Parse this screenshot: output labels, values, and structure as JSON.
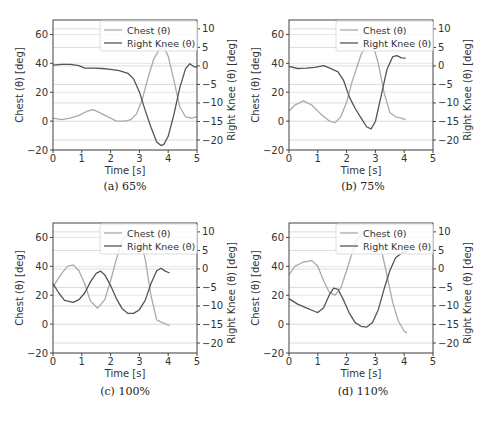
{
  "chart_data": [
    {
      "type": "line",
      "caption": "(a) 65%",
      "xlabel": "Time [s]",
      "ylabel": "Chest (θ) [deg]",
      "ylabel_right": "Right Knee (θ) [deg]",
      "xlim": [
        0,
        5
      ],
      "ylim": [
        -20,
        70
      ],
      "ylim_right": [
        -22.7,
        12.4
      ],
      "xticks": [
        0,
        1,
        2,
        3,
        4,
        5
      ],
      "yticks": [
        -20,
        0,
        20,
        40,
        60
      ],
      "yticks_right": [
        -20,
        -15,
        -10,
        -5,
        0,
        5,
        10
      ],
      "legend": [
        "Chest (θ)",
        "Right Knee (θ)"
      ],
      "legend_position": "upper right",
      "grid": "horizontal",
      "series": [
        {
          "name": "Chest (θ)",
          "axis": "left",
          "color": "#aaaaaa",
          "x": [
            0,
            0.3,
            0.6,
            0.9,
            1.2,
            1.4,
            1.6,
            1.8,
            2.0,
            2.2,
            2.5,
            2.7,
            2.9,
            3.1,
            3.3,
            3.5,
            3.7,
            3.85,
            4.0,
            4.2,
            4.4,
            4.6,
            4.8,
            5.0
          ],
          "values": [
            2,
            1,
            2,
            4,
            7,
            8,
            6,
            4,
            2,
            0,
            0,
            1,
            5,
            15,
            30,
            43,
            50,
            51,
            45,
            28,
            10,
            3,
            2,
            3
          ]
        },
        {
          "name": "Right Knee (θ)",
          "axis": "right",
          "color": "#555555",
          "x": [
            0,
            0.3,
            0.6,
            0.9,
            1.1,
            1.4,
            1.7,
            2.0,
            2.3,
            2.6,
            2.8,
            3.0,
            3.2,
            3.4,
            3.6,
            3.75,
            3.85,
            4.0,
            4.2,
            4.4,
            4.6,
            4.75,
            4.9,
            5.0
          ],
          "values": [
            0.2,
            0.4,
            0.4,
            0.1,
            -0.6,
            -0.6,
            -0.7,
            -0.9,
            -1.3,
            -2,
            -3.5,
            -7,
            -12,
            -16.5,
            -20.5,
            -21.5,
            -21.2,
            -19,
            -13,
            -6,
            -0.8,
            0.6,
            -0.2,
            -0.4
          ]
        }
      ]
    },
    {
      "type": "line",
      "caption": "(b) 75%",
      "xlabel": "Time [s]",
      "ylabel": "Chest (θ) [deg]",
      "ylabel_right": "Right Knee (θ) [deg]",
      "xlim": [
        0,
        5
      ],
      "ylim": [
        -20,
        70
      ],
      "ylim_right": [
        -22.7,
        12.4
      ],
      "xticks": [
        0,
        1,
        2,
        3,
        4,
        5
      ],
      "yticks": [
        -20,
        0,
        20,
        40,
        60
      ],
      "yticks_right": [
        -20,
        -15,
        -10,
        -5,
        0,
        5,
        10
      ],
      "legend": [
        "Chest (θ)",
        "Right Knee (θ)"
      ],
      "legend_position": "upper right",
      "grid": "horizontal",
      "series": [
        {
          "name": "Chest (θ)",
          "axis": "left",
          "color": "#aaaaaa",
          "x": [
            0,
            0.2,
            0.5,
            0.8,
            1.1,
            1.4,
            1.6,
            1.8,
            2.0,
            2.2,
            2.5,
            2.75,
            2.9,
            3.1,
            3.3,
            3.5,
            3.7,
            3.9,
            4.05
          ],
          "values": [
            7,
            11,
            14,
            11,
            5,
            0,
            -1,
            3,
            13,
            28,
            46,
            55,
            54,
            40,
            20,
            6,
            3,
            2,
            1
          ]
        },
        {
          "name": "Right Knee (θ)",
          "axis": "right",
          "color": "#555555",
          "x": [
            0,
            0.3,
            0.6,
            0.9,
            1.2,
            1.4,
            1.7,
            1.9,
            2.1,
            2.3,
            2.5,
            2.7,
            2.85,
            3.0,
            3.2,
            3.4,
            3.6,
            3.75,
            3.9,
            4.05
          ],
          "values": [
            -0.1,
            -0.7,
            -0.6,
            -0.4,
            0.1,
            -0.5,
            -1.6,
            -4,
            -8.5,
            -11.5,
            -14,
            -16.5,
            -17,
            -15,
            -8,
            -1,
            2.5,
            2.8,
            2.2,
            2.1
          ]
        }
      ]
    },
    {
      "type": "line",
      "caption": "(c) 100%",
      "xlabel": "Time [s]",
      "ylabel": "Chest (θ) [deg]",
      "ylabel_right": "Right Knee (θ) [deg]",
      "xlim": [
        0,
        5
      ],
      "ylim": [
        -20,
        70
      ],
      "ylim_right": [
        -22.7,
        12.4
      ],
      "xticks": [
        0,
        1,
        2,
        3,
        4,
        5
      ],
      "yticks": [
        -20,
        0,
        20,
        40,
        60
      ],
      "yticks_right": [
        -20,
        -15,
        -10,
        -5,
        0,
        5,
        10
      ],
      "legend": [
        "Chest (θ)",
        "Right Knee (θ)"
      ],
      "legend_position": "upper right",
      "grid": "horizontal",
      "series": [
        {
          "name": "Chest (θ)",
          "axis": "left",
          "color": "#aaaaaa",
          "x": [
            0,
            0.3,
            0.5,
            0.7,
            0.9,
            1.1,
            1.3,
            1.55,
            1.8,
            2.0,
            2.2,
            2.4,
            2.6,
            2.8,
            3.0,
            3.2,
            3.4,
            3.6,
            3.8,
            4.05
          ],
          "values": [
            26,
            35,
            40,
            41,
            37,
            28,
            16,
            11,
            17,
            30,
            45,
            58,
            62,
            63,
            60,
            45,
            20,
            3,
            1,
            -1
          ]
        },
        {
          "name": "Right Knee (θ)",
          "axis": "right",
          "color": "#555555",
          "x": [
            0,
            0.2,
            0.4,
            0.7,
            0.9,
            1.1,
            1.3,
            1.5,
            1.65,
            1.8,
            2.0,
            2.2,
            2.4,
            2.6,
            2.8,
            3.0,
            3.2,
            3.4,
            3.6,
            3.75,
            3.9,
            4.05
          ],
          "values": [
            -4,
            -6.5,
            -8.5,
            -9,
            -8.3,
            -6.5,
            -3.5,
            -1.2,
            -0.6,
            -1.6,
            -4.5,
            -8,
            -10.7,
            -12,
            -12,
            -11,
            -8.5,
            -4,
            -0.5,
            0.2,
            -0.6,
            -1.1
          ]
        }
      ]
    },
    {
      "type": "line",
      "caption": "(d) 110%",
      "xlabel": "Time [s]",
      "ylabel": "Chest (θ) [deg]",
      "ylabel_right": "Right Knee (θ) [deg]",
      "xlim": [
        0,
        5
      ],
      "ylim": [
        -20,
        70
      ],
      "ylim_right": [
        -22.7,
        12.4
      ],
      "xticks": [
        0,
        1,
        2,
        3,
        4,
        5
      ],
      "yticks": [
        -20,
        0,
        20,
        40,
        60
      ],
      "yticks_right": [
        -20,
        -15,
        -10,
        -5,
        0,
        5,
        10
      ],
      "legend": [
        "Chest (θ)",
        "Right Knee (θ)"
      ],
      "legend_position": "upper right",
      "grid": "horizontal",
      "series": [
        {
          "name": "Chest (θ)",
          "axis": "left",
          "color": "#aaaaaa",
          "x": [
            0,
            0.2,
            0.5,
            0.8,
            1.0,
            1.2,
            1.4,
            1.6,
            1.8,
            2.0,
            2.2,
            2.4,
            2.6,
            2.8,
            3.0,
            3.2,
            3.4,
            3.6,
            3.8,
            4.0,
            4.1
          ],
          "values": [
            34,
            40,
            43,
            44,
            40,
            30,
            22,
            20,
            25,
            37,
            50,
            60,
            64,
            65,
            62,
            52,
            34,
            15,
            2,
            -5,
            -6
          ]
        },
        {
          "name": "Right Knee (θ)",
          "axis": "right",
          "color": "#555555",
          "x": [
            0,
            0.3,
            0.6,
            0.9,
            1.0,
            1.2,
            1.4,
            1.55,
            1.7,
            1.9,
            2.1,
            2.3,
            2.5,
            2.7,
            2.9,
            3.1,
            3.3,
            3.5,
            3.7,
            3.9,
            4.1
          ],
          "values": [
            -8,
            -9.5,
            -10.5,
            -11.5,
            -11.8,
            -10.5,
            -7,
            -5.2,
            -5.5,
            -8.5,
            -12,
            -14.5,
            -15.5,
            -15.7,
            -14.5,
            -11,
            -5.5,
            -0.5,
            3,
            4.2,
            4.7
          ]
        }
      ]
    }
  ]
}
